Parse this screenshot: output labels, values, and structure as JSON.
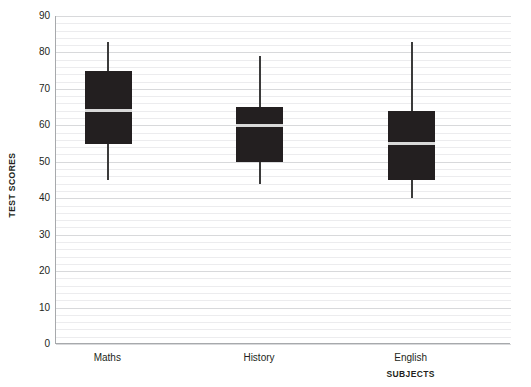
{
  "chart_data": {
    "type": "box",
    "title": "",
    "xlabel": "SUBJECTS",
    "ylabel": "TEST SCORES",
    "ylim": [
      0,
      90
    ],
    "y_major_step": 10,
    "y_minor_step": 2,
    "grid": "horizontal",
    "legend": "none",
    "categories": [
      "Maths",
      "History",
      "English"
    ],
    "y_tick_labels": [
      "90",
      "80",
      "70",
      "60",
      "50",
      "40",
      "30",
      "20",
      "10",
      "0"
    ],
    "y_tick_values": [
      90,
      80,
      70,
      60,
      50,
      40,
      30,
      20,
      10,
      0
    ],
    "boxes": [
      {
        "category": "Maths",
        "min": 45,
        "q1": 55,
        "median": 64,
        "q3": 75,
        "max": 83
      },
      {
        "category": "History",
        "min": 44,
        "q1": 50,
        "median": 60,
        "q3": 65,
        "max": 79
      },
      {
        "category": "English",
        "min": 40,
        "q1": 45,
        "median": 55,
        "q3": 64,
        "max": 83
      }
    ],
    "colors": {
      "box_fill": "#231f20",
      "median": "#d9d9d9",
      "whisker": "#3b3b3b",
      "gridline_major": "#d8d9db",
      "gridline_minor": "#ececee",
      "axis": "#a7a9ac",
      "text": "#231f20",
      "background": "#ffffff"
    }
  }
}
